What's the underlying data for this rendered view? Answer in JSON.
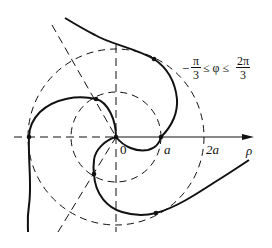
{
  "diagram": {
    "type": "polar curve (three-armed spiral) with reference circles",
    "axis_label": "ρ",
    "origin_label": "0",
    "tick_labels": [
      "a",
      "2a"
    ],
    "range": {
      "prefix": "−",
      "lower_num": "π",
      "lower_den": "3",
      "middle": "≤ φ ≤",
      "upper_num": "2π",
      "upper_den": "3"
    },
    "circles": [
      {
        "name": "inner",
        "radius": "a",
        "style": "dashed"
      },
      {
        "name": "outer",
        "radius": "2a",
        "style": "dashed"
      }
    ],
    "colors": {
      "stroke": "#111111",
      "background": "#ffffff"
    }
  }
}
